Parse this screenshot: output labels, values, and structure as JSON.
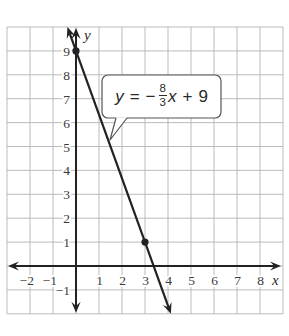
{
  "chart_data": {
    "type": "line",
    "title": "",
    "xlabel": "x",
    "ylabel": "y",
    "xlim": [
      -3,
      9
    ],
    "ylim": [
      -2,
      10
    ],
    "grid": true,
    "legend": null,
    "x_ticks": [
      -2,
      -1,
      1,
      2,
      3,
      4,
      5,
      6,
      7,
      8
    ],
    "x_tick_labels": [
      "−2",
      "−1",
      "1",
      "2",
      "3",
      "4",
      "5",
      "6",
      "7",
      "8"
    ],
    "y_ticks": [
      -1,
      1,
      2,
      3,
      4,
      5,
      6,
      7,
      8,
      9
    ],
    "y_tick_labels": [
      "−1",
      "1",
      "2",
      "3",
      "4",
      "5",
      "6",
      "7",
      "8",
      "9"
    ],
    "series": [
      {
        "name": "y = −8/3x + 9",
        "slope": -2.6667,
        "intercept": 9,
        "x": [
          -0.375,
          4.125
        ],
        "y": [
          10,
          -2
        ],
        "color": "#222222",
        "arrows_both_ends": true
      }
    ],
    "points": [
      {
        "x": 0,
        "y": 9
      },
      {
        "x": 3,
        "y": 1
      }
    ],
    "annotations": [
      {
        "type": "callout",
        "text": "y = −8/3 x + 9",
        "points_to": {
          "x": 1.4,
          "y": 5.2
        }
      }
    ]
  },
  "callout": {
    "var_y": "y",
    "equals": "=",
    "minus": "−",
    "numerator": "8",
    "denominator": "3",
    "var_x": "x",
    "plus": "+",
    "constant": "9"
  },
  "colors": {
    "grid": "#b3b3b3",
    "axis": "#222222",
    "line": "#222222",
    "point": "#222222",
    "callout_border": "#555555"
  }
}
